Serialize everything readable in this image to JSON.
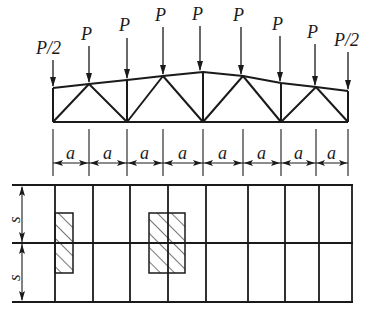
{
  "diagram": {
    "loads": [
      {
        "label": "P/2",
        "x": 53,
        "topY": 88
      },
      {
        "label": "P",
        "x": 89,
        "topY": 84
      },
      {
        "label": "P",
        "x": 127,
        "topY": 80
      },
      {
        "label": "P",
        "x": 163,
        "topY": 76
      },
      {
        "label": "P",
        "x": 203,
        "topY": 72
      },
      {
        "label": "P",
        "x": 243,
        "topY": 76
      },
      {
        "label": "P",
        "x": 281,
        "topY": 83
      },
      {
        "label": "P",
        "x": 316,
        "topY": 87
      },
      {
        "label": "P/2",
        "x": 348,
        "topY": 91
      }
    ],
    "panel_label": "a",
    "panel_count": 8,
    "spacing_label": "s",
    "colors": {
      "line": "#1a1a1a",
      "background": "#ffffff"
    }
  }
}
